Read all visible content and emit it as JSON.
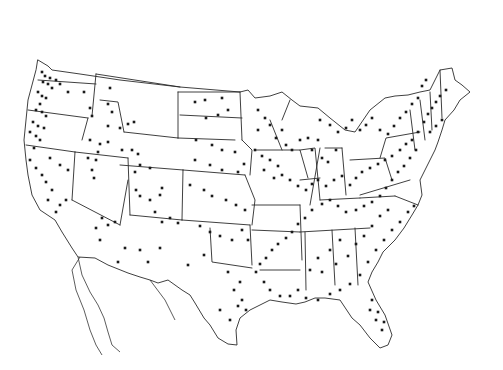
{
  "map": {
    "title": "",
    "region": "Contiguous United States",
    "background_color": "#ffffff",
    "line_color": "#2a2a2a",
    "dot_color": "#1a1a1a",
    "dot_radius": 1.3,
    "marker_type": "square-dot",
    "boundaries": {
      "us_outline": "M38,60 L48,66 L52,70 L80,74 L120,80 L180,87 L240,92 L248,90 L255,98 L270,96 L282,92 L292,100 L300,106 L318,108 L330,118 L345,130 L355,132 L370,110 L385,98 L395,96 L408,95 L420,92 L430,90 L440,70 L452,68 L455,80 L462,85 L470,92 L460,100 L454,110 L445,120 L442,130 L438,142 L435,150 L430,160 L425,170 L420,180 L422,195 L418,205 L412,215 L404,228 L395,240 L383,252 L378,262 L372,272 L368,282 L376,300 L385,315 L392,335 L388,345 L380,348 L370,338 L360,325 L352,318 L340,300 L325,298 L315,298 L305,302 L296,304 L282,302 L270,300 L262,304 L250,310 L240,318 L236,330 L237,345 L228,344 L218,338 L210,325 L204,318 L195,303 L190,295 L182,290 L168,280 L158,283 L150,280 L140,277 L128,273 L108,265 L95,258 L78,257 L72,248 L62,232 L55,220 L40,210 L32,195 L28,175 L26,160 L24,140 L26,120 L28,100 L32,85 L36,70 Z",
      "states": [
        "M38,80 L96,84",
        "M96,74 L92,116",
        "M28,110 L88,118",
        "M88,118 L82,140",
        "M26,145 L75,152",
        "M75,152 L72,200",
        "M72,200 L120,225",
        "M120,225 L128,180",
        "M75,152 L128,158",
        "M96,74 L180,87",
        "M100,100 L118,102 L124,132",
        "M124,132 L178,138",
        "M178,138 L178,92",
        "M128,158 L130,215",
        "M130,215 L182,220",
        "M182,220 L183,170",
        "M183,170 L120,165",
        "M178,138 L235,140",
        "M183,170 L245,175",
        "M182,220 L250,225",
        "M250,225 L252,265",
        "M210,228 L212,262 L252,268",
        "M178,92 L240,92",
        "M180,115 L242,118",
        "M240,92 L242,140",
        "M245,175 L255,200 L252,225",
        "M242,140 L252,150 L250,175",
        "M252,205 L300,205",
        "M300,205 L302,260",
        "M252,230 L300,232",
        "M260,270 L300,270",
        "M300,180 L320,178",
        "M255,150 L300,150 L308,178",
        "M270,120 L282,150",
        "M282,120 L290,100",
        "M300,150 L315,148 L320,200",
        "M320,200 L360,198",
        "M360,198 L395,196",
        "M300,232 L370,228",
        "M305,232 L306,290",
        "M332,230 L335,285",
        "M355,228 L358,285",
        "M310,205 L320,148",
        "M325,148 L342,148",
        "M342,148 L346,195",
        "M350,160 L385,158 L392,180",
        "M360,195 L410,180",
        "M395,196 L418,205",
        "M380,158 L386,138 L420,132",
        "M410,110 L415,150",
        "M420,100 L425,140",
        "M430,92 L432,130",
        "M440,70 L442,118"
      ],
      "mexico_coast": "M78,257 L82,275 L90,292 L98,305 L104,318 L108,332 L112,345 L120,352 M80,257 L72,270 L76,290 L84,310 L90,330 L96,345 L102,355 M150,280 L165,300 L175,320"
    },
    "dots": [
      [
        42,
        72
      ],
      [
        45,
        76
      ],
      [
        50,
        78
      ],
      [
        43,
        82
      ],
      [
        48,
        84
      ],
      [
        52,
        88
      ],
      [
        56,
        80
      ],
      [
        60,
        84
      ],
      [
        38,
        92
      ],
      [
        42,
        96
      ],
      [
        46,
        98
      ],
      [
        40,
        104
      ],
      [
        36,
        110
      ],
      [
        42,
        112
      ],
      [
        46,
        116
      ],
      [
        33,
        122
      ],
      [
        38,
        126
      ],
      [
        44,
        128
      ],
      [
        30,
        132
      ],
      [
        36,
        136
      ],
      [
        40,
        140
      ],
      [
        34,
        148
      ],
      [
        30,
        160
      ],
      [
        36,
        168
      ],
      [
        42,
        175
      ],
      [
        46,
        182
      ],
      [
        52,
        190
      ],
      [
        48,
        200
      ],
      [
        60,
        205
      ],
      [
        66,
        200
      ],
      [
        56,
        212
      ],
      [
        50,
        158
      ],
      [
        60,
        165
      ],
      [
        68,
        170
      ],
      [
        68,
        92
      ],
      [
        84,
        92
      ],
      [
        90,
        108
      ],
      [
        92,
        116
      ],
      [
        110,
        88
      ],
      [
        108,
        104
      ],
      [
        112,
        112
      ],
      [
        108,
        126
      ],
      [
        120,
        128
      ],
      [
        128,
        124
      ],
      [
        134,
        122
      ],
      [
        90,
        140
      ],
      [
        100,
        144
      ],
      [
        108,
        142
      ],
      [
        98,
        152
      ],
      [
        88,
        158
      ],
      [
        96,
        160
      ],
      [
        92,
        170
      ],
      [
        94,
        178
      ],
      [
        122,
        150
      ],
      [
        132,
        150
      ],
      [
        138,
        154
      ],
      [
        140,
        165
      ],
      [
        135,
        172
      ],
      [
        150,
        168
      ],
      [
        136,
        190
      ],
      [
        140,
        196
      ],
      [
        150,
        200
      ],
      [
        160,
        195
      ],
      [
        162,
        188
      ],
      [
        155,
        212
      ],
      [
        162,
        222
      ],
      [
        170,
        218
      ],
      [
        178,
        223
      ],
      [
        102,
        218
      ],
      [
        108,
        225
      ],
      [
        115,
        222
      ],
      [
        96,
        228
      ],
      [
        100,
        240
      ],
      [
        125,
        248
      ],
      [
        118,
        262
      ],
      [
        140,
        250
      ],
      [
        148,
        262
      ],
      [
        160,
        248
      ],
      [
        195,
        102
      ],
      [
        205,
        100
      ],
      [
        222,
        98
      ],
      [
        206,
        118
      ],
      [
        218,
        115
      ],
      [
        228,
        110
      ],
      [
        196,
        140
      ],
      [
        212,
        145
      ],
      [
        222,
        150
      ],
      [
        235,
        152
      ],
      [
        195,
        160
      ],
      [
        210,
        165
      ],
      [
        222,
        170
      ],
      [
        238,
        172
      ],
      [
        244,
        164
      ],
      [
        190,
        185
      ],
      [
        204,
        190
      ],
      [
        212,
        196
      ],
      [
        226,
        200
      ],
      [
        236,
        205
      ],
      [
        245,
        210
      ],
      [
        200,
        226
      ],
      [
        210,
        232
      ],
      [
        220,
        236
      ],
      [
        232,
        240
      ],
      [
        242,
        230
      ],
      [
        248,
        240
      ],
      [
        188,
        265
      ],
      [
        204,
        255
      ],
      [
        228,
        272
      ],
      [
        240,
        282
      ],
      [
        234,
        290
      ],
      [
        242,
        300
      ],
      [
        238,
        306
      ],
      [
        246,
        310
      ],
      [
        220,
        310
      ],
      [
        230,
        320
      ],
      [
        258,
        110
      ],
      [
        265,
        118
      ],
      [
        270,
        125
      ],
      [
        258,
        130
      ],
      [
        276,
        138
      ],
      [
        282,
        130
      ],
      [
        286,
        145
      ],
      [
        292,
        150
      ],
      [
        300,
        140
      ],
      [
        308,
        138
      ],
      [
        318,
        140
      ],
      [
        312,
        150
      ],
      [
        322,
        158
      ],
      [
        328,
        162
      ],
      [
        336,
        150
      ],
      [
        255,
        150
      ],
      [
        262,
        156
      ],
      [
        270,
        160
      ],
      [
        278,
        166
      ],
      [
        264,
        170
      ],
      [
        274,
        178
      ],
      [
        282,
        175
      ],
      [
        290,
        180
      ],
      [
        298,
        186
      ],
      [
        306,
        190
      ],
      [
        312,
        184
      ],
      [
        318,
        180
      ],
      [
        326,
        186
      ],
      [
        334,
        180
      ],
      [
        342,
        176
      ],
      [
        350,
        185
      ],
      [
        356,
        178
      ],
      [
        362,
        172
      ],
      [
        370,
        168
      ],
      [
        378,
        164
      ],
      [
        385,
        160
      ],
      [
        392,
        156
      ],
      [
        400,
        150
      ],
      [
        406,
        144
      ],
      [
        412,
        140
      ],
      [
        418,
        132
      ],
      [
        424,
        122
      ],
      [
        428,
        114
      ],
      [
        432,
        108
      ],
      [
        436,
        102
      ],
      [
        440,
        96
      ],
      [
        446,
        90
      ],
      [
        430,
        132
      ],
      [
        436,
        126
      ],
      [
        442,
        120
      ],
      [
        416,
        150
      ],
      [
        410,
        158
      ],
      [
        404,
        166
      ],
      [
        398,
        172
      ],
      [
        392,
        180
      ],
      [
        386,
        188
      ],
      [
        380,
        196
      ],
      [
        372,
        202
      ],
      [
        364,
        206
      ],
      [
        356,
        210
      ],
      [
        346,
        212
      ],
      [
        338,
        206
      ],
      [
        330,
        200
      ],
      [
        322,
        204
      ],
      [
        312,
        210
      ],
      [
        305,
        218
      ],
      [
        298,
        224
      ],
      [
        292,
        232
      ],
      [
        286,
        238
      ],
      [
        278,
        244
      ],
      [
        272,
        250
      ],
      [
        266,
        258
      ],
      [
        260,
        264
      ],
      [
        256,
        272
      ],
      [
        264,
        282
      ],
      [
        270,
        290
      ],
      [
        280,
        296
      ],
      [
        290,
        296
      ],
      [
        298,
        290
      ],
      [
        306,
        298
      ],
      [
        318,
        300
      ],
      [
        330,
        294
      ],
      [
        340,
        290
      ],
      [
        350,
        284
      ],
      [
        360,
        275
      ],
      [
        368,
        262
      ],
      [
        376,
        250
      ],
      [
        384,
        240
      ],
      [
        392,
        230
      ],
      [
        400,
        222
      ],
      [
        408,
        212
      ],
      [
        414,
        206
      ],
      [
        340,
        240
      ],
      [
        330,
        250
      ],
      [
        318,
        258
      ],
      [
        310,
        270
      ],
      [
        322,
        272
      ],
      [
        336,
        264
      ],
      [
        348,
        256
      ],
      [
        356,
        244
      ],
      [
        364,
        236
      ],
      [
        372,
        226
      ],
      [
        380,
        216
      ],
      [
        388,
        210
      ],
      [
        372,
        300
      ],
      [
        378,
        312
      ],
      [
        384,
        322
      ],
      [
        382,
        330
      ],
      [
        376,
        320
      ],
      [
        370,
        310
      ],
      [
        320,
        120
      ],
      [
        330,
        125
      ],
      [
        338,
        132
      ],
      [
        346,
        128
      ],
      [
        352,
        120
      ],
      [
        360,
        130
      ],
      [
        366,
        125
      ],
      [
        372,
        118
      ],
      [
        380,
        130
      ],
      [
        388,
        134
      ],
      [
        394,
        126
      ],
      [
        400,
        118
      ],
      [
        406,
        112
      ],
      [
        412,
        104
      ],
      [
        418,
        98
      ],
      [
        422,
        86
      ],
      [
        426,
        80
      ]
    ]
  }
}
